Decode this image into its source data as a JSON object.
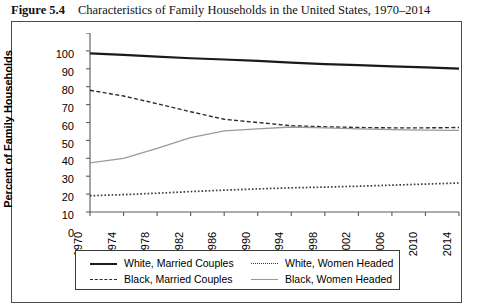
{
  "figure": {
    "label": "Figure 5.4",
    "title": "Characteristics of Family Households in the United States, 1970–2014"
  },
  "chart_data": {
    "type": "line",
    "title": "Characteristics of Family Households in the United States, 1970–2014",
    "xlabel": "",
    "ylabel": "Percent of Family Households",
    "xlim": [
      1970,
      2014
    ],
    "ylim": [
      0,
      100
    ],
    "ytick_step": 10,
    "xtick_step": 4,
    "grid": false,
    "legend_position": "bottom",
    "x": [
      1970,
      1974,
      1978,
      1982,
      1986,
      1990,
      1994,
      1998,
      2002,
      2006,
      2010,
      2014
    ],
    "categories": [
      "1970",
      "1974",
      "1978",
      "1982",
      "1986",
      "1990",
      "1994",
      "1998",
      "2002",
      "2006",
      "2010",
      "2014"
    ],
    "yticks": [
      "0",
      "10",
      "20",
      "30",
      "40",
      "50",
      "60",
      "70",
      "80",
      "90",
      "100"
    ],
    "series": [
      {
        "name": "White, Married Couples",
        "style": "solid-thick",
        "color": "#1a1a1a",
        "values": [
          88.6,
          87.8,
          86.8,
          85.9,
          85.2,
          84.4,
          83.4,
          82.6,
          82.0,
          81.4,
          80.8,
          80.1
        ]
      },
      {
        "name": "Black, Married Couples",
        "style": "dashed",
        "color": "#2b2b2b",
        "values": [
          68.0,
          64.8,
          60.5,
          56.0,
          51.8,
          50.0,
          48.2,
          47.6,
          47.2,
          47.0,
          47.0,
          47.2
        ]
      },
      {
        "name": "White, Women Headed",
        "style": "dotted",
        "color": "#3a3a3a",
        "values": [
          9.1,
          9.7,
          10.5,
          11.4,
          12.2,
          12.9,
          13.5,
          13.9,
          14.4,
          15.0,
          15.6,
          16.2
        ]
      },
      {
        "name": "Black, Women Headed",
        "style": "solid-thin",
        "color": "#9a9a9a",
        "values": [
          27.4,
          30.0,
          35.5,
          41.5,
          45.3,
          46.4,
          47.5,
          47.0,
          46.4,
          46.0,
          45.7,
          45.6
        ]
      }
    ]
  },
  "legend": {
    "entries": [
      {
        "label": "White, Married Couples",
        "style": "solid-thick"
      },
      {
        "label": "White, Women Headed",
        "style": "dotted"
      },
      {
        "label": "Black, Married Couples",
        "style": "dashed"
      },
      {
        "label": "Black, Women Headed",
        "style": "solid-thin"
      }
    ]
  }
}
